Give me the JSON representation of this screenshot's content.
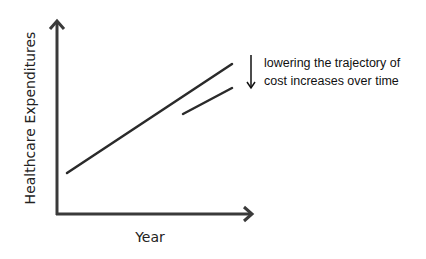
{
  "diagram": {
    "y_axis_label": "Healthcare Expenditures",
    "x_axis_label": "Year",
    "annotation": {
      "line1": "lowering the trajectory of",
      "line2": "cost increases over time",
      "arrow": "down-arrow"
    },
    "colors": {
      "line": "#2a2a2a",
      "axis": "#3a3a3a",
      "text": "#111111"
    }
  }
}
